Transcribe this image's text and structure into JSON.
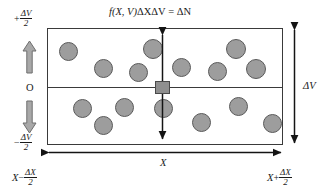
{
  "figure": {
    "title_formula": {
      "fn": "f",
      "args": "(X, V)",
      "term1": "ΔXΔV",
      "equals": "=",
      "result": "ΔN",
      "full_text": "f(X, V)ΔXΔV = ΔN"
    },
    "axes": {
      "vertical_top_label": {
        "sign": "+",
        "numerator": "ΔV",
        "denominator": "2"
      },
      "vertical_origin_label": "O",
      "vertical_bottom_label": {
        "sign": "−",
        "numerator": "ΔV",
        "denominator": "2"
      },
      "horizontal_left_label": {
        "var": "X",
        "sign": "−",
        "numerator": "ΔX",
        "denominator": "2"
      },
      "horizontal_right_label": {
        "var": "X",
        "sign": "+",
        "numerator": "ΔX",
        "denominator": "2"
      },
      "horizontal_span_label": "X",
      "vertical_span_label": "ΔV"
    },
    "colors": {
      "particle_fill": "#9d9d9d",
      "particle_stroke": "#5a5a5a",
      "square_fill": "#8f8f8f",
      "box_stroke": "#3a3a3a",
      "block_arrow_fill": "#a8a8a8",
      "block_arrow_stroke": "#6e6e6e",
      "text": "#1a1a1a"
    },
    "box": {
      "left": 47,
      "top": 28,
      "width": 236,
      "height": 117,
      "midline_y": 87
    },
    "sample_square": {
      "x": 155,
      "y": 81,
      "width": 15,
      "height": 13
    },
    "particles_upper": [
      {
        "cx": 68,
        "cy": 51,
        "r": 9.5
      },
      {
        "cx": 103,
        "cy": 68,
        "r": 9.5
      },
      {
        "cx": 138,
        "cy": 72,
        "r": 9.5
      },
      {
        "cx": 153,
        "cy": 49,
        "r": 10
      },
      {
        "cx": 181,
        "cy": 67,
        "r": 9.5
      },
      {
        "cx": 217,
        "cy": 71,
        "r": 9.5
      },
      {
        "cx": 236,
        "cy": 49,
        "r": 10
      },
      {
        "cx": 256,
        "cy": 69,
        "r": 10
      }
    ],
    "particles_lower": [
      {
        "cx": 82,
        "cy": 108,
        "r": 9.5
      },
      {
        "cx": 103,
        "cy": 125,
        "r": 9.5
      },
      {
        "cx": 124,
        "cy": 107,
        "r": 9.5
      },
      {
        "cx": 163,
        "cy": 108,
        "r": 9.5
      },
      {
        "cx": 201,
        "cy": 122,
        "r": 9.5
      },
      {
        "cx": 238,
        "cy": 106,
        "r": 9.5
      },
      {
        "cx": 272,
        "cy": 123,
        "r": 9.5
      }
    ],
    "particle_count_upper": 8,
    "particle_count_lower": 7
  }
}
